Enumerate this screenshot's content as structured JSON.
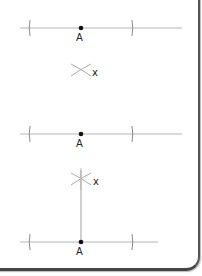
{
  "figures": [
    {
      "step": 1,
      "line": {
        "x1": 20,
        "x2": 182,
        "y": 28
      },
      "ticks": [
        30,
        132
      ],
      "point": {
        "x": 81,
        "y": 28,
        "label": "A"
      },
      "intersection": {
        "x": 81,
        "y": 70,
        "label": "x",
        "style": "cross"
      }
    },
    {
      "step": 2,
      "line": {
        "x1": 20,
        "x2": 182,
        "y": 134
      },
      "ticks": [
        30,
        132
      ],
      "point": {
        "x": 81,
        "y": 134,
        "label": "A"
      },
      "intersection": {
        "x": 81,
        "y": 179,
        "label": "x",
        "style": "star"
      }
    },
    {
      "step": 3,
      "line": {
        "x1": 20,
        "x2": 158,
        "y": 242
      },
      "ticks": [
        30,
        132
      ],
      "point": {
        "x": 81,
        "y": 242,
        "label": "A"
      },
      "perpendicular": {
        "x": 81,
        "y1": 170,
        "y2": 242
      }
    }
  ],
  "colors": {
    "line": "#b5b5b5",
    "tick": "#8a8a8a",
    "point": "#111111",
    "label": "#222222",
    "arc": "#aaaaaa"
  }
}
